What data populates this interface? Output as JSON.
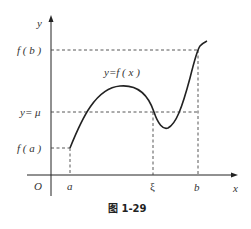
{
  "figure": {
    "caption": "图 1-29",
    "axes": {
      "x_label": "x",
      "y_label": "y",
      "origin_label": "O"
    },
    "x_ticks": [
      {
        "id": "a",
        "label": "a"
      },
      {
        "id": "xi",
        "label": "ξ"
      },
      {
        "id": "b",
        "label": "b"
      }
    ],
    "y_ticks": [
      {
        "id": "fb",
        "label": "f ( b )"
      },
      {
        "id": "mu",
        "label": "y= μ"
      },
      {
        "id": "fa",
        "label": "f ( a )"
      }
    ],
    "curve_label": "y=f ( x )",
    "colors": {
      "stroke": "#222222",
      "dash": "#444444",
      "text": "#333333"
    }
  }
}
